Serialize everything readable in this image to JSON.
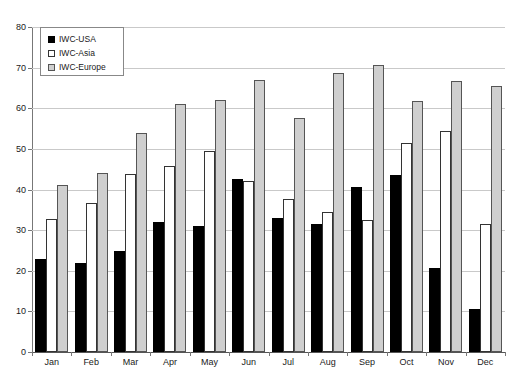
{
  "chart_data": {
    "type": "bar",
    "title": "",
    "subtitle": "",
    "xlabel": "",
    "ylabel": "",
    "ylim": [
      0,
      80
    ],
    "yticks": [
      0,
      10,
      20,
      30,
      40,
      50,
      60,
      70,
      80
    ],
    "grid": true,
    "legend_position": "top-left",
    "categories": [
      "Jan",
      "Feb",
      "Mar",
      "Apr",
      "May",
      "Jun",
      "Jul",
      "Aug",
      "Sep",
      "Oct",
      "Nov",
      "Dec"
    ],
    "series": [
      {
        "name": "IWC-USA",
        "color": "#000000",
        "values": [
          23,
          22,
          24.8,
          32,
          31,
          42.5,
          33,
          31.6,
          40.7,
          43.6,
          20.6,
          10.5
        ]
      },
      {
        "name": "IWC-Asia",
        "color": "#ffffff",
        "values": [
          32.8,
          36.6,
          43.8,
          45.7,
          49.6,
          42,
          37.6,
          34.5,
          32.5,
          51.5,
          54.5,
          31.5
        ]
      },
      {
        "name": "IWC-Europe",
        "color": "#cfcfcf",
        "values": [
          41,
          44,
          54,
          61,
          62,
          67,
          57.7,
          68.7,
          70.6,
          61.7,
          66.6,
          65.5
        ]
      }
    ]
  },
  "legend": {
    "items": [
      {
        "label": "IWC-USA",
        "swatch": "usa"
      },
      {
        "label": "IWC-Asia",
        "swatch": "asia"
      },
      {
        "label": "IWC-Europe",
        "swatch": "europe"
      }
    ]
  }
}
